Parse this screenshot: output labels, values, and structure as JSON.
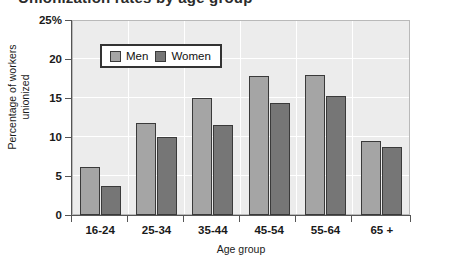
{
  "title_cropped": "Unionization rates by age group",
  "chart_data": {
    "type": "bar",
    "title": "",
    "xlabel": "Age group",
    "ylabel": "Percentage of workers unionized",
    "ylabel_line1": "Percentage of workers",
    "ylabel_line2": "unionized",
    "categories": [
      "16-24",
      "25-34",
      "35-44",
      "45-54",
      "55-64",
      "65 +"
    ],
    "series": [
      {
        "name": "Men",
        "color": "#a5a5a5",
        "values": [
          6.1,
          11.8,
          15.0,
          17.8,
          17.9,
          9.5
        ]
      },
      {
        "name": "Women",
        "color": "#767676",
        "values": [
          3.7,
          10.0,
          11.6,
          14.3,
          15.3,
          8.7
        ]
      }
    ],
    "ylim": [
      0,
      25
    ],
    "yticks": [
      0,
      5,
      10,
      15,
      20,
      25
    ],
    "ytick_labels": [
      "0",
      "5",
      "10",
      "15",
      "20",
      "25%"
    ],
    "grid": true,
    "legend_position": "top-left-inside",
    "plot_background": "#ececec"
  }
}
